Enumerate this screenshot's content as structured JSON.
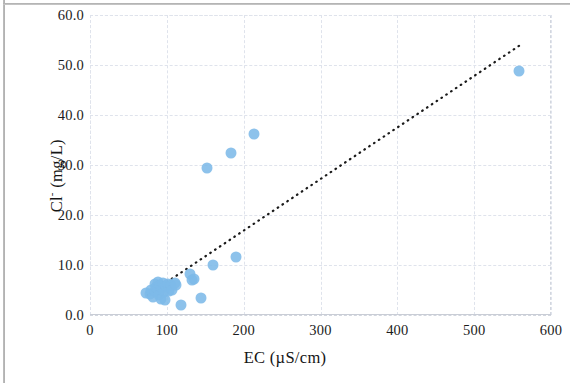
{
  "chart_data": {
    "type": "scatter",
    "title": "",
    "xlabel": "EC (µS/cm)",
    "ylabel": "Cl⁻ (mg/L)",
    "ylabel_base": "Cl",
    "ylabel_sup": "-",
    "ylabel_rest": " (mg/L)",
    "xlim": [
      0,
      600
    ],
    "ylim": [
      0,
      60
    ],
    "xticks": [
      "0",
      "100",
      "200",
      "300",
      "400",
      "500",
      "600"
    ],
    "xtick_values": [
      0,
      100,
      200,
      300,
      400,
      500,
      600
    ],
    "yticks": [
      "0.0",
      "10.0",
      "20.0",
      "30.0",
      "40.0",
      "50.0",
      "60.0"
    ],
    "ytick_values": [
      0,
      10,
      20,
      30,
      40,
      50,
      60
    ],
    "grid": true,
    "grid_style": "dashed",
    "legend": "none",
    "marker_color": "#7db9e8",
    "trendline": {
      "style": "dotted",
      "color": "#1a1a1a",
      "x_start": 75,
      "y_start": 4.0,
      "x_end": 560,
      "y_end": 54.0
    },
    "series": [
      {
        "name": "Samples",
        "points": [
          [
            73,
            4.4
          ],
          [
            78,
            4.2
          ],
          [
            80,
            5.0
          ],
          [
            82,
            3.6
          ],
          [
            84,
            4.8
          ],
          [
            85,
            6.3
          ],
          [
            86,
            5.6
          ],
          [
            88,
            6.6
          ],
          [
            89,
            5.2
          ],
          [
            90,
            4.0
          ],
          [
            91,
            6.1
          ],
          [
            92,
            3.2
          ],
          [
            94,
            5.4
          ],
          [
            95,
            6.4
          ],
          [
            96,
            4.6
          ],
          [
            98,
            3.0
          ],
          [
            99,
            5.8
          ],
          [
            101,
            6.2
          ],
          [
            103,
            4.9
          ],
          [
            105,
            6.0
          ],
          [
            107,
            5.1
          ],
          [
            110,
            6.5
          ],
          [
            112,
            6.0
          ],
          [
            118,
            2.0
          ],
          [
            130,
            8.2
          ],
          [
            133,
            7.0
          ],
          [
            136,
            7.3
          ],
          [
            145,
            3.4
          ],
          [
            152,
            29.5
          ],
          [
            160,
            10.0
          ],
          [
            183,
            32.5
          ],
          [
            190,
            11.7
          ],
          [
            213,
            36.2
          ],
          [
            558,
            48.8
          ]
        ]
      }
    ]
  },
  "figure": {
    "background": "#ffffff",
    "plot_left_px": 90,
    "plot_top_px": 15,
    "plot_width_px": 461,
    "plot_height_px": 300
  }
}
